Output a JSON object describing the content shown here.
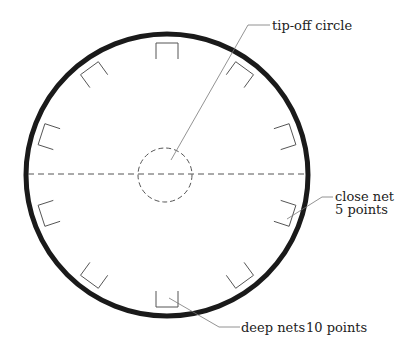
{
  "diagram": {
    "colors": {
      "ring": "#1a1a1a",
      "lines": "#555555",
      "text": "#222222",
      "background": "#ffffff"
    },
    "board": {
      "cx": 167,
      "cy": 175,
      "r": 141,
      "stroke_width": 5
    },
    "center_line": {
      "style": "dashed"
    },
    "tipoff_circle": {
      "cx": 165,
      "cy": 175,
      "r": 27,
      "style": "dashed"
    },
    "nets": {
      "count": 10,
      "angles_deg": [
        90,
        54,
        18,
        -18,
        -54,
        -90,
        -126,
        -162,
        162,
        126
      ],
      "inner_radius": 116,
      "outer_radius": 132,
      "width": 22
    },
    "labels": {
      "tipoff": "tip-off circle",
      "close_net_line1": "close net",
      "close_net_line2": "5 points",
      "deep_nets": "deep nets",
      "deep_nets_points": "10 points"
    }
  }
}
